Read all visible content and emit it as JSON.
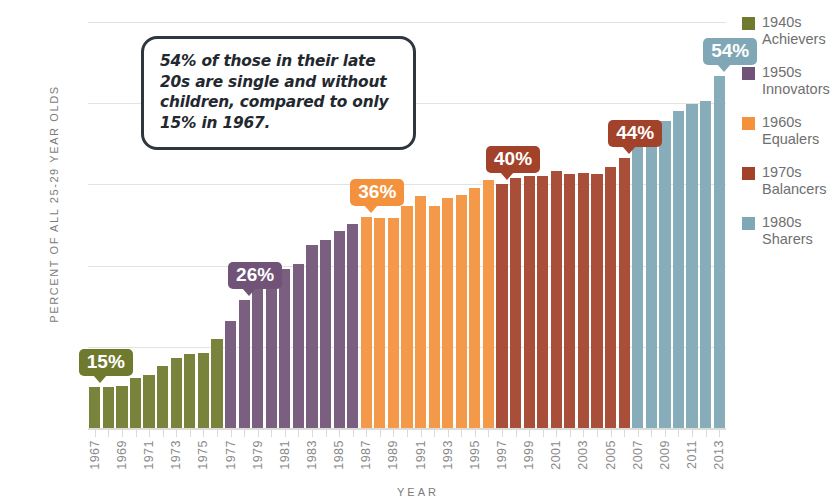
{
  "chart_data": {
    "type": "bar",
    "title": "",
    "xlabel": "YEAR",
    "ylabel": "PERCENT OF ALL 25-29 YEAR OLDS",
    "ylim": [
      10,
      60
    ],
    "ytick_values": [
      60,
      50,
      40,
      30,
      20,
      10
    ],
    "ytick_labels": [
      "60%",
      "50%",
      "40%",
      "30%",
      "20%",
      "10%"
    ],
    "grid": true,
    "legend_position": "right",
    "annotation": "54% of those in their late 20s are single and without children, compared to only 15% in 1967.",
    "categories": [
      "1967",
      "1968",
      "1969",
      "1970",
      "1971",
      "1972",
      "1973",
      "1974",
      "1975",
      "1976",
      "1977",
      "1978",
      "1979",
      "1980",
      "1981",
      "1982",
      "1983",
      "1984",
      "1985",
      "1986",
      "1987",
      "1988",
      "1989",
      "1990",
      "1991",
      "1992",
      "1993",
      "1994",
      "1995",
      "1996",
      "1997",
      "1998",
      "1999",
      "2000",
      "2001",
      "2002",
      "2003",
      "2004",
      "2005",
      "2006",
      "2007",
      "2008",
      "2009",
      "2010",
      "2011",
      "2012",
      "2013"
    ],
    "tick_labels": [
      "1967",
      "",
      "1969",
      "",
      "1971",
      "",
      "1973",
      "",
      "1975",
      "",
      "1977",
      "",
      "1979",
      "",
      "1981",
      "",
      "1983",
      "",
      "1985",
      "",
      "1987",
      "",
      "1989",
      "",
      "1991",
      "",
      "1993",
      "",
      "1995",
      "",
      "1997",
      "",
      "1999",
      "",
      "2001",
      "",
      "2003",
      "",
      "2005",
      "",
      "2007",
      "",
      "2009",
      "",
      "2011",
      "",
      "2013"
    ],
    "values": [
      15.0,
      15.1,
      15.2,
      16.2,
      16.5,
      17.6,
      18.6,
      19.1,
      19.2,
      21.0,
      23.2,
      25.8,
      27.1,
      28.4,
      29.6,
      30.2,
      32.6,
      33.1,
      34.3,
      35.1,
      36.0,
      35.9,
      35.9,
      37.3,
      38.6,
      37.3,
      38.3,
      38.7,
      39.6,
      40.6,
      40.0,
      40.8,
      41.0,
      41.0,
      41.6,
      41.3,
      41.4,
      41.3,
      42.2,
      43.2,
      45.1,
      46.6,
      47.8,
      49.0,
      49.9,
      50.3,
      53.3
    ],
    "series": [
      {
        "name": "1940s Achievers",
        "start_year": 1967,
        "end_year": 1976,
        "color": "#6f7a2e"
      },
      {
        "name": "1950s Innovators",
        "start_year": 1977,
        "end_year": 1986,
        "color": "#705377"
      },
      {
        "name": "1960s Equalers",
        "start_year": 1987,
        "end_year": 1996,
        "color": "#f4913d"
      },
      {
        "name": "1970s Balancers",
        "start_year": 1997,
        "end_year": 2006,
        "color": "#a3422a"
      },
      {
        "name": "1980s Sharers",
        "start_year": 2007,
        "end_year": 2013,
        "color": "#7fa7b5"
      }
    ],
    "callouts": [
      {
        "label": "15%",
        "year": "1967",
        "value": 15.0,
        "color": "#6f7a2e"
      },
      {
        "label": "26%",
        "year": "1978",
        "value": 25.8,
        "color": "#705377"
      },
      {
        "label": "36%",
        "year": "1987",
        "value": 36.0,
        "color": "#f4913d"
      },
      {
        "label": "40%",
        "year": "1997",
        "value": 40.0,
        "color": "#a3422a"
      },
      {
        "label": "44%",
        "year": "2006",
        "value": 43.2,
        "color": "#a3422a"
      },
      {
        "label": "54%",
        "year": "2013",
        "value": 53.3,
        "color": "#7fa7b5"
      }
    ]
  },
  "legend": {
    "items": [
      {
        "decade": "1940s",
        "name": "Achievers",
        "color": "#6f7a2e"
      },
      {
        "decade": "1950s",
        "name": "Innovators",
        "color": "#705377"
      },
      {
        "decade": "1960s",
        "name": "Equalers",
        "color": "#f4913d"
      },
      {
        "decade": "1970s",
        "name": "Balancers",
        "color": "#a3422a"
      },
      {
        "decade": "1980s",
        "name": "Sharers",
        "color": "#7fa7b5"
      }
    ]
  }
}
